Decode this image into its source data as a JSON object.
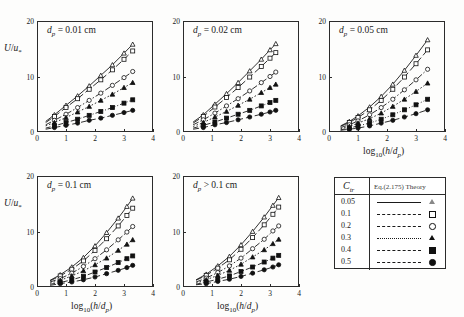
{
  "figure": {
    "top_cropped_text": "",
    "axis": {
      "ylabel": "U/u*",
      "xlabel": "log10(h/dp)",
      "yticks": [
        "0",
        "10",
        "20"
      ],
      "xticks": [
        "0",
        "1",
        "2",
        "3",
        "4"
      ],
      "ylim": [
        0,
        20
      ],
      "xlim": [
        0,
        4
      ]
    },
    "panels": [
      {
        "id": "panel-dp-0-01",
        "title_var": "dp",
        "title_rel": "=",
        "title_val": "0.01",
        "title_unit": "cm",
        "show_ylabel": true,
        "show_xlabel": false
      },
      {
        "id": "panel-dp-0-02",
        "title_var": "dp",
        "title_rel": "=",
        "title_val": "0.02",
        "title_unit": "cm",
        "show_ylabel": false,
        "show_xlabel": false
      },
      {
        "id": "panel-dp-0-05",
        "title_var": "dp",
        "title_rel": "=",
        "title_val": "0.05",
        "title_unit": "cm",
        "show_ylabel": false,
        "show_xlabel": true
      },
      {
        "id": "panel-dp-0-1",
        "title_var": "dp",
        "title_rel": "=",
        "title_val": "0.1",
        "title_unit": "cm",
        "show_ylabel": true,
        "show_xlabel": true
      },
      {
        "id": "panel-dp-gt-0-1",
        "title_var": "dp",
        "title_rel": ">",
        "title_val": "0.1",
        "title_unit": "cm",
        "show_ylabel": false,
        "show_xlabel": true
      }
    ],
    "legend": {
      "header_left": "Ctr",
      "header_right": "Eq.(2.175)  Theory",
      "rows": [
        {
          "value": "0.05",
          "dash": "solid",
          "marker": "triangle-open"
        },
        {
          "value": "0.1",
          "dash": "dash-long",
          "marker": "square-open"
        },
        {
          "value": "0.2",
          "dash": "dash-dot",
          "marker": "circle-open"
        },
        {
          "value": "0.3",
          "dash": "dotted",
          "marker": "triangle-filled"
        },
        {
          "value": "0.4",
          "dash": "dash-dot-dot",
          "marker": "square-filled"
        },
        {
          "value": "0.5",
          "dash": "dash-med",
          "marker": "circle-filled"
        }
      ]
    }
  },
  "chart_data": {
    "type": "line",
    "xlabel": "log10(h/dp)",
    "ylabel": "U/u*",
    "xlim": [
      0,
      4
    ],
    "ylim": [
      0,
      20
    ],
    "xticks": [
      0,
      1,
      2,
      3,
      4
    ],
    "yticks": [
      0,
      10,
      20
    ],
    "grid": false,
    "legend_position": "bottom-right-external",
    "legend_title": "Ctr",
    "legend_subtitle": "Eq.(2.175)  Theory",
    "panels": [
      {
        "name": "dp = 0.01 cm",
        "x": [
          0.3,
          0.6,
          1.0,
          1.4,
          1.8,
          2.2,
          2.6,
          3.0,
          3.3
        ],
        "series": [
          {
            "name": "0.05",
            "values": [
              1.9,
              3.1,
              4.8,
              6.5,
              8.3,
              10.2,
              12.1,
              14.2,
              15.8
            ]
          },
          {
            "name": "0.1",
            "values": [
              1.7,
              2.8,
              4.4,
              6.0,
              7.7,
              9.4,
              11.2,
              13.1,
              14.6
            ]
          },
          {
            "name": "0.2",
            "values": [
              1.3,
              2.1,
              3.2,
              4.4,
              5.7,
              7.0,
              8.4,
              9.8,
              10.9
            ]
          },
          {
            "name": "0.3",
            "values": [
              1.1,
              1.7,
              2.6,
              3.6,
              4.6,
              5.7,
              6.8,
              8.0,
              8.9
            ]
          },
          {
            "name": "0.4",
            "values": [
              0.7,
              1.1,
              1.7,
              2.3,
              3.0,
              3.7,
              4.4,
              5.2,
              5.8
            ]
          },
          {
            "name": "0.5",
            "values": [
              0.5,
              0.8,
              1.2,
              1.6,
              2.1,
              2.5,
              3.0,
              3.5,
              3.9
            ]
          }
        ]
      },
      {
        "name": "dp = 0.02 cm",
        "x": [
          0.35,
          0.7,
          1.1,
          1.5,
          1.9,
          2.3,
          2.7,
          3.0,
          3.2
        ],
        "series": [
          {
            "name": "0.05",
            "values": [
              1.8,
              3.1,
              5.0,
              6.9,
              8.9,
              11.0,
              13.1,
              14.8,
              15.9
            ]
          },
          {
            "name": "0.1",
            "values": [
              1.6,
              2.8,
              4.5,
              6.2,
              8.0,
              9.9,
              11.8,
              13.3,
              14.3
            ]
          },
          {
            "name": "0.2",
            "values": [
              1.3,
              2.2,
              3.4,
              4.7,
              6.0,
              7.4,
              8.9,
              10.0,
              10.8
            ]
          },
          {
            "name": "0.3",
            "values": [
              1.0,
              1.7,
              2.7,
              3.7,
              4.8,
              5.9,
              7.1,
              8.0,
              8.6
            ]
          },
          {
            "name": "0.4",
            "values": [
              0.7,
              1.2,
              1.8,
              2.5,
              3.2,
              3.9,
              4.7,
              5.3,
              5.7
            ]
          },
          {
            "name": "0.5",
            "values": [
              0.5,
              0.8,
              1.3,
              1.7,
              2.2,
              2.7,
              3.2,
              3.6,
              3.9
            ]
          }
        ]
      },
      {
        "name": "dp = 0.05 cm",
        "x": [
          0.4,
          0.7,
          1.0,
          1.4,
          1.8,
          2.2,
          2.6,
          3.0,
          3.4
        ],
        "series": [
          {
            "name": "0.05",
            "values": [
              1.1,
              1.9,
              2.9,
              4.5,
              6.4,
              8.6,
              11.1,
              13.8,
              16.6
            ]
          },
          {
            "name": "0.1",
            "values": [
              1.0,
              1.7,
              2.6,
              4.0,
              5.7,
              7.7,
              9.9,
              12.3,
              14.8
            ]
          },
          {
            "name": "0.2",
            "values": [
              0.8,
              1.3,
              2.0,
              3.1,
              4.4,
              5.9,
              7.6,
              9.4,
              11.3
            ]
          },
          {
            "name": "0.3",
            "values": [
              0.6,
              1.0,
              1.6,
              2.4,
              3.4,
              4.6,
              5.9,
              7.3,
              8.8
            ]
          },
          {
            "name": "0.4",
            "values": [
              0.4,
              0.7,
              1.1,
              1.6,
              2.3,
              3.1,
              4.0,
              4.9,
              5.9
            ]
          },
          {
            "name": "0.5",
            "values": [
              0.3,
              0.5,
              0.7,
              1.1,
              1.6,
              2.1,
              2.7,
              3.3,
              4.0
            ]
          }
        ]
      },
      {
        "name": "dp = 0.1 cm",
        "x": [
          0.45,
          0.8,
          1.2,
          1.6,
          2.0,
          2.4,
          2.8,
          3.1,
          3.3
        ],
        "series": [
          {
            "name": "0.05",
            "values": [
              1.2,
              2.2,
              3.6,
              5.3,
              7.4,
              9.8,
              12.4,
              14.5,
              16.0
            ]
          },
          {
            "name": "0.1",
            "values": [
              1.1,
              2.0,
              3.2,
              4.7,
              6.6,
              8.7,
              11.0,
              12.9,
              14.2
            ]
          },
          {
            "name": "0.2",
            "values": [
              0.9,
              1.5,
              2.5,
              3.7,
              5.1,
              6.7,
              8.5,
              9.9,
              10.9
            ]
          },
          {
            "name": "0.3",
            "values": [
              0.7,
              1.2,
              2.0,
              2.9,
              4.0,
              5.2,
              6.6,
              7.7,
              8.5
            ]
          },
          {
            "name": "0.4",
            "values": [
              0.5,
              0.8,
              1.3,
              1.9,
              2.7,
              3.5,
              4.4,
              5.1,
              5.6
            ]
          },
          {
            "name": "0.5",
            "values": [
              0.3,
              0.6,
              0.9,
              1.3,
              1.8,
              2.4,
              3.0,
              3.5,
              3.9
            ]
          }
        ]
      },
      {
        "name": "dp > 0.1 cm",
        "x": [
          0.45,
          0.8,
          1.2,
          1.6,
          2.0,
          2.4,
          2.8,
          3.1,
          3.3
        ],
        "series": [
          {
            "name": "0.05",
            "values": [
              1.3,
              2.3,
              3.8,
              5.5,
              7.6,
              10.0,
              12.6,
              14.7,
              16.1
            ]
          },
          {
            "name": "0.1",
            "values": [
              1.2,
              2.1,
              3.4,
              4.9,
              6.8,
              8.9,
              11.2,
              13.1,
              14.4
            ]
          },
          {
            "name": "0.2",
            "values": [
              0.9,
              1.6,
              2.6,
              3.8,
              5.2,
              6.9,
              8.6,
              10.1,
              11.0
            ]
          },
          {
            "name": "0.3",
            "values": [
              0.7,
              1.3,
              2.1,
              3.0,
              4.1,
              5.4,
              6.7,
              7.8,
              8.6
            ]
          },
          {
            "name": "0.4",
            "values": [
              0.5,
              0.9,
              1.4,
              2.0,
              2.8,
              3.6,
              4.5,
              5.2,
              5.7
            ]
          },
          {
            "name": "0.5",
            "values": [
              0.4,
              0.6,
              1.0,
              1.4,
              1.9,
              2.5,
              3.1,
              3.6,
              4.0
            ]
          }
        ]
      }
    ]
  }
}
